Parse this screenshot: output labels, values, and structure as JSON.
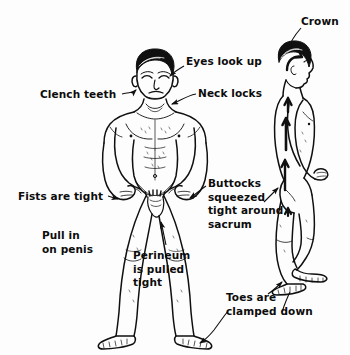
{
  "figure": {
    "background_color": "#fdfdfd",
    "ink_color": "#101010",
    "style": "pen-and-ink line drawing"
  },
  "subjects": [
    {
      "name": "front-view-figure",
      "description": "Nude male figure, frontal view, arms akimbo with fists on hips, legs spread, feet flat"
    },
    {
      "name": "side-view-figure",
      "description": "Nude male figure, right profile view, arrows along spine pointing upward toward crown, knees slightly bent, toes clamped"
    }
  ],
  "labels": [
    {
      "id": "clench-teeth",
      "lines": [
        "Clench teeth"
      ],
      "points_to": "jaw of front figure"
    },
    {
      "id": "eyes-look-up",
      "lines": [
        "Eyes look up"
      ],
      "points_to": "eyes of front figure"
    },
    {
      "id": "neck-locks",
      "lines": [
        "Neck locks"
      ],
      "points_to": "neck of front figure"
    },
    {
      "id": "crown",
      "lines": [
        "Crown"
      ],
      "points_to": "top of head of side figure"
    },
    {
      "id": "fists-are-tight",
      "lines": [
        "Fists are tight"
      ],
      "points_to": "left fist of front figure"
    },
    {
      "id": "pull-in-on-penis",
      "lines": [
        "Pull in",
        "on penis"
      ],
      "points_to": "groin of front figure"
    },
    {
      "id": "perineum-is-pulled-tight",
      "lines": [
        "Perineum",
        "is pulled",
        "tight"
      ],
      "points_to": "perineum of front figure"
    },
    {
      "id": "buttocks-squeezed-tight-around-sacrum",
      "lines": [
        "Buttocks",
        "squeezed",
        "tight around",
        "sacrum"
      ],
      "points_to": "buttocks of side figure"
    },
    {
      "id": "toes-are-clamped-down",
      "lines": [
        "Toes are",
        "clamped down"
      ],
      "points_to": "toes of side figure and front figure"
    }
  ]
}
